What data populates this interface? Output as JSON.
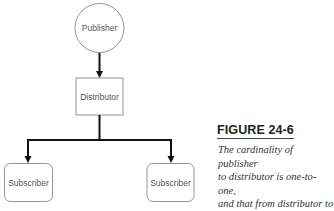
{
  "diagram": {
    "nodes": [
      {
        "id": "publisher",
        "label": "Publisher",
        "shape": "circle"
      },
      {
        "id": "distributor",
        "label": "Distributor",
        "shape": "rectangle"
      },
      {
        "id": "subscriber_left",
        "label": "Subscriber",
        "shape": "rounded-rectangle"
      },
      {
        "id": "subscriber_right",
        "label": "Subscriber",
        "shape": "rounded-rectangle"
      }
    ],
    "edges": [
      {
        "from": "publisher",
        "to": "distributor"
      },
      {
        "from": "distributor",
        "to": "subscriber_left"
      },
      {
        "from": "distributor",
        "to": "subscriber_right"
      }
    ]
  },
  "caption": {
    "title": "FIGURE 24-6",
    "text": "The cardinality of publisher\nto distributor is one-to-one,\nand that from distributor to\nsubscriber is one-to-many."
  }
}
